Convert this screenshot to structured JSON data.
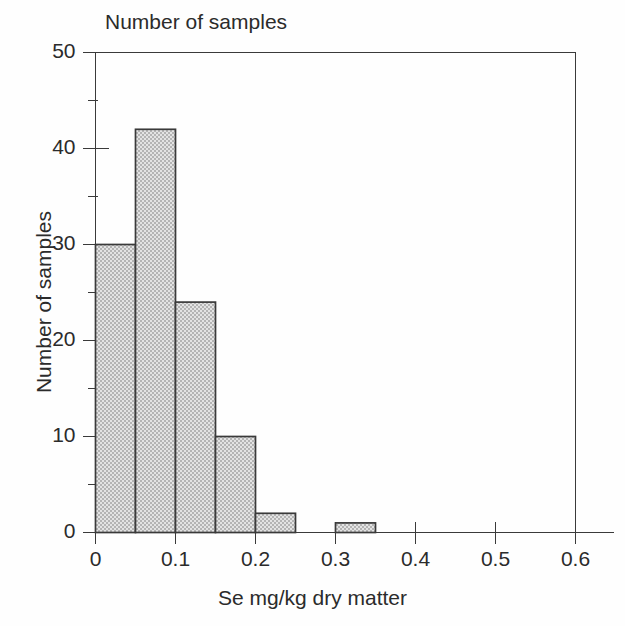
{
  "chart_data": {
    "type": "bar",
    "title": "Number of samples",
    "xlabel": "Se mg/kg dry matter",
    "ylabel": "Number of samples",
    "subtitle": "",
    "bin_width": 0.05,
    "categories": [
      "0.00-0.05",
      "0.05-0.10",
      "0.10-0.15",
      "0.15-0.20",
      "0.20-0.25",
      "0.30-0.35"
    ],
    "bin_starts": [
      0.0,
      0.05,
      0.1,
      0.15,
      0.2,
      0.3
    ],
    "bin_ends": [
      0.05,
      0.1,
      0.15,
      0.2,
      0.25,
      0.35
    ],
    "values": [
      30,
      42,
      24,
      10,
      2,
      1
    ],
    "x": [
      0.025,
      0.075,
      0.125,
      0.175,
      0.225,
      0.325
    ],
    "xlim": [
      0,
      0.6
    ],
    "ylim": [
      0,
      50
    ],
    "xticks": [
      0,
      0.1,
      0.2,
      0.3,
      0.4,
      0.5,
      0.6
    ],
    "xtick_labels": [
      "0",
      "0.1",
      "0.2",
      "0.3",
      "0.4",
      "0.5",
      "0.6"
    ],
    "yticks": [
      0,
      10,
      20,
      30,
      40,
      50
    ],
    "ytick_labels": [
      "0",
      "10",
      "20",
      "30",
      "40",
      "50"
    ],
    "y_minor_ticks": [
      5,
      15,
      25,
      35,
      45
    ],
    "grid": false,
    "legend": null,
    "total_samples": 109,
    "colors": {
      "bar_fill": "#c9c9c9",
      "bar_edge": "#3a3a3a",
      "axis": "#3a3a3a",
      "text": "#2b2b2b",
      "background": "#ffffff"
    }
  }
}
